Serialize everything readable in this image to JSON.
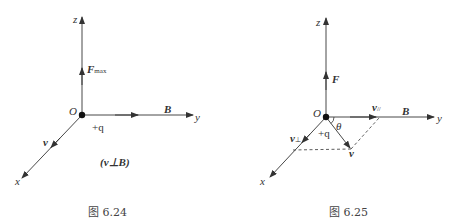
{
  "figures": [
    {
      "id": "fig-6-24",
      "caption": "图 6.24",
      "labels": {
        "z_axis": "z",
        "y_axis": "y",
        "x_axis": "x",
        "origin": "O",
        "force": "F",
        "force_sub": "max",
        "field": "B",
        "velocity": "v",
        "charge": "+q",
        "condition": "(v⊥B)"
      }
    },
    {
      "id": "fig-6-25",
      "caption": "图 6.25",
      "labels": {
        "z_axis": "z",
        "y_axis": "y",
        "x_axis": "x",
        "origin": "O",
        "force": "F",
        "field": "B",
        "velocity": "v",
        "v_parallel": "v",
        "v_parallel_sub": "//",
        "v_perp": "v",
        "v_perp_sub": "⊥",
        "charge": "+q",
        "angle": "θ"
      }
    }
  ],
  "colors": {
    "line": "#333333",
    "text": "#333333",
    "background": "#ffffff"
  }
}
